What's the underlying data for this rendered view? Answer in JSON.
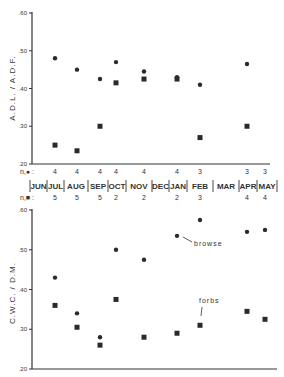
{
  "chart_data": [
    {
      "type": "scatter",
      "title": "",
      "xlabel": "",
      "ylabel": "A.D.L. / A.D.F.",
      "ylim": [
        0.2,
        0.6
      ],
      "yticks": [
        ".60",
        ".50",
        ".40",
        ".30",
        ".20"
      ],
      "categories": [
        "JUN",
        "JUL",
        "AUG",
        "SEP",
        "OCT",
        "NOV",
        "DEC",
        "JAN",
        "FEB",
        "MAR",
        "APR",
        "MAY"
      ],
      "series": [
        {
          "name": "circle",
          "marker": "circle",
          "points": [
            [
              "JUL",
              0.48
            ],
            [
              "AUG",
              0.45
            ],
            [
              "SEP",
              0.425
            ],
            [
              "OCT",
              0.47
            ],
            [
              "NOV",
              0.445
            ],
            [
              "JAN",
              0.43
            ],
            [
              "FEB",
              0.41
            ],
            [
              "APR",
              0.465
            ]
          ]
        },
        {
          "name": "square",
          "marker": "square",
          "points": [
            [
              "JUL",
              0.25
            ],
            [
              "AUG",
              0.235
            ],
            [
              "SEP",
              0.3
            ],
            [
              "OCT",
              0.415
            ],
            [
              "NOV",
              0.425
            ],
            [
              "JAN",
              0.425
            ],
            [
              "FEB",
              0.27
            ],
            [
              "APR",
              0.3
            ]
          ]
        }
      ],
      "n_circle_label": "n,● :",
      "n_circle": [
        [
          "JUL",
          "4"
        ],
        [
          "AUG",
          "4"
        ],
        [
          "SEP",
          "4"
        ],
        [
          "OCT",
          "4"
        ],
        [
          "NOV",
          "4"
        ],
        [
          "JAN",
          "4"
        ],
        [
          "FEB",
          "3"
        ],
        [
          "APR",
          "3"
        ],
        [
          "MAY",
          "3"
        ]
      ],
      "grid": false
    },
    {
      "type": "scatter",
      "title": "",
      "xlabel": "",
      "ylabel": "C.W.C. / D.M.",
      "ylim": [
        0.2,
        0.6
      ],
      "yticks": [
        ".60",
        ".50",
        ".40",
        ".30",
        ".20"
      ],
      "categories": [
        "JUN",
        "JUL",
        "AUG",
        "SEP",
        "OCT",
        "NOV",
        "DEC",
        "JAN",
        "FEB",
        "MAR",
        "APR",
        "MAY"
      ],
      "series": [
        {
          "name": "browse",
          "marker": "circle",
          "points": [
            [
              "JUL",
              0.43
            ],
            [
              "AUG",
              0.34
            ],
            [
              "SEP",
              0.28
            ],
            [
              "OCT",
              0.5
            ],
            [
              "NOV",
              0.475
            ],
            [
              "JAN",
              0.535
            ],
            [
              "FEB",
              0.575
            ],
            [
              "APR",
              0.545
            ],
            [
              "MAY",
              0.55
            ]
          ]
        },
        {
          "name": "forbs",
          "marker": "square",
          "points": [
            [
              "JUL",
              0.36
            ],
            [
              "AUG",
              0.305
            ],
            [
              "SEP",
              0.26
            ],
            [
              "OCT",
              0.375
            ],
            [
              "NOV",
              0.28
            ],
            [
              "JAN",
              0.29
            ],
            [
              "FEB",
              0.31
            ],
            [
              "APR",
              0.345
            ],
            [
              "MAY",
              0.325
            ]
          ]
        }
      ],
      "n_square_label": "n,■ :",
      "n_square": [
        [
          "JUL",
          "5"
        ],
        [
          "AUG",
          "5"
        ],
        [
          "SEP",
          "5"
        ],
        [
          "OCT",
          "2"
        ],
        [
          "NOV",
          "2"
        ],
        [
          "JAN",
          "2"
        ],
        [
          "FEB",
          "3"
        ],
        [
          "APR",
          "4"
        ],
        [
          "MAY",
          "4"
        ]
      ],
      "annotations": [
        "browse",
        "forbs"
      ],
      "grid": false
    }
  ],
  "labels": {
    "top_ylabel": "A.D.L. / A.D.F.",
    "bottom_ylabel": "C.W.C. / D.M.",
    "n_circle_label": "n,● :",
    "n_square_label": "n,■ :",
    "browse": "browse",
    "forbs": "forbs",
    "ticks": [
      ".60",
      ".50",
      ".40",
      ".30",
      ".20"
    ],
    "months": [
      "JUN",
      "JUL",
      "AUG",
      "SEP",
      "OCT",
      "NOV",
      "DEC",
      "JAN",
      "FEB",
      "MAR",
      "APR",
      "MAY"
    ]
  }
}
